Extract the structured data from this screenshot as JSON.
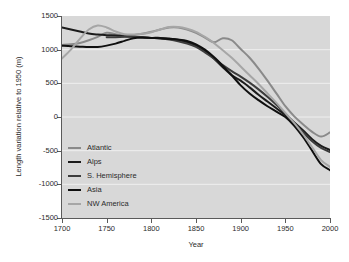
{
  "chart_data": {
    "type": "line",
    "title": "",
    "xlabel": "Year",
    "ylabel": "Length variation relative to 1950 (m)",
    "xlim": [
      1700,
      2000
    ],
    "ylim": [
      -1500,
      1500
    ],
    "xticks": [
      1700,
      1750,
      1800,
      1850,
      1900,
      1950,
      2000
    ],
    "yticks": [
      1500,
      1000,
      500,
      0,
      -500,
      -1000,
      -1500
    ],
    "grid": true,
    "grid_color": "#efefef",
    "plot_background": "#d8d8d8",
    "legend_position": "inside-lower-left",
    "series": [
      {
        "name": "Atlantic",
        "color": "#8a8a8a",
        "x": [
          1700,
          1710,
          1720,
          1730,
          1740,
          1750,
          1760,
          1770,
          1780,
          1790,
          1800,
          1810,
          1820,
          1830,
          1840,
          1850,
          1860,
          1870,
          1880,
          1890,
          1900,
          1910,
          1920,
          1930,
          1940,
          1950,
          1960,
          1970,
          1980,
          1990,
          2000
        ],
        "values": [
          1070,
          1080,
          1100,
          1140,
          1190,
          1250,
          1230,
          1210,
          1215,
          1235,
          1265,
          1300,
          1330,
          1330,
          1300,
          1250,
          1180,
          1110,
          1170,
          1140,
          1010,
          880,
          720,
          540,
          350,
          160,
          10,
          -110,
          -220,
          -290,
          -230
        ]
      },
      {
        "name": "Alps",
        "color": "#1b1b1b",
        "x": [
          1700,
          1710,
          1720,
          1730,
          1740,
          1750,
          1760,
          1770,
          1780,
          1790,
          1800,
          1810,
          1820,
          1830,
          1840,
          1850,
          1860,
          1870,
          1880,
          1890,
          1900,
          1910,
          1920,
          1930,
          1940,
          1950,
          1960,
          1970,
          1980,
          1990,
          2000
        ],
        "values": [
          1330,
          1300,
          1270,
          1240,
          1225,
          1215,
          1210,
          1200,
          1190,
          1180,
          1175,
          1175,
          1165,
          1145,
          1110,
          1060,
          980,
          870,
          740,
          620,
          540,
          440,
          330,
          230,
          130,
          30,
          -80,
          -200,
          -330,
          -430,
          -490
        ]
      },
      {
        "name": "S. Hemisphere",
        "color": "#3c3c3c",
        "x": [
          1750,
          1760,
          1770,
          1780,
          1790,
          1800,
          1810,
          1820,
          1830,
          1840,
          1850,
          1860,
          1870,
          1880,
          1890,
          1900,
          1910,
          1920,
          1930,
          1940,
          1950,
          1960,
          1970,
          1980,
          1990,
          2000
        ],
        "values": [
          1185,
          1185,
          1190,
          1190,
          1185,
          1175,
          1165,
          1150,
          1125,
          1090,
          1040,
          960,
          870,
          770,
          680,
          600,
          510,
          410,
          300,
          180,
          50,
          -90,
          -230,
          -360,
          -460,
          -520
        ]
      },
      {
        "name": "Asia",
        "color": "#0f0f0f",
        "x": [
          1700,
          1710,
          1720,
          1730,
          1740,
          1750,
          1760,
          1770,
          1780,
          1790,
          1800,
          1810,
          1820,
          1830,
          1840,
          1850,
          1860,
          1870,
          1880,
          1890,
          1900,
          1910,
          1920,
          1930,
          1940,
          1950,
          1960,
          1970,
          1980,
          1990,
          2000
        ],
        "values": [
          1060,
          1050,
          1045,
          1040,
          1040,
          1060,
          1090,
          1130,
          1170,
          1180,
          1175,
          1170,
          1160,
          1150,
          1130,
          1080,
          1000,
          890,
          760,
          620,
          470,
          350,
          250,
          160,
          80,
          0,
          -130,
          -300,
          -500,
          -700,
          -790
        ]
      },
      {
        "name": "NW America",
        "color": "#a6a6a6",
        "x": [
          1700,
          1710,
          1720,
          1730,
          1740,
          1750,
          1760,
          1770,
          1780,
          1790,
          1800,
          1810,
          1820,
          1830,
          1840,
          1850,
          1860,
          1870,
          1880,
          1890,
          1900,
          1910,
          1920,
          1930,
          1940,
          1950,
          1960,
          1970,
          1980,
          1990,
          2000
        ],
        "values": [
          870,
          1000,
          1160,
          1300,
          1360,
          1330,
          1270,
          1230,
          1225,
          1235,
          1260,
          1300,
          1335,
          1335,
          1310,
          1265,
          1190,
          1100,
          990,
          880,
          750,
          620,
          490,
          350,
          210,
          60,
          -90,
          -260,
          -450,
          -640,
          -740
        ]
      }
    ]
  },
  "axes": {
    "x_tick_labels": [
      "1700",
      "1750",
      "1800",
      "1850",
      "1900",
      "1950",
      "2000"
    ],
    "y_tick_labels": [
      "1500",
      "1000",
      "500",
      "0",
      "-500",
      "-1000",
      "-1500"
    ],
    "x_axis_title": "Year",
    "y_axis_title": "Length variation relative to 1950 (m)"
  },
  "legend": {
    "items": [
      {
        "label": "Atlantic",
        "color": "#8a8a8a"
      },
      {
        "label": "Alps",
        "color": "#1b1b1b"
      },
      {
        "label": "S. Hemisphere",
        "color": "#3c3c3c"
      },
      {
        "label": "Asia",
        "color": "#0f0f0f"
      },
      {
        "label": "NW America",
        "color": "#a6a6a6"
      }
    ]
  }
}
